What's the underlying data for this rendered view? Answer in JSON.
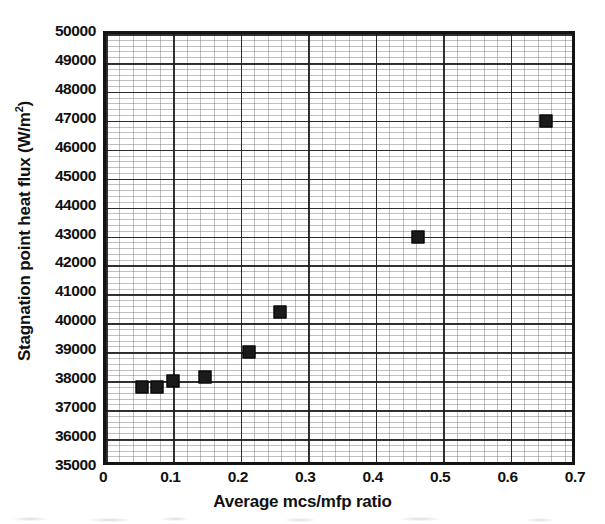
{
  "chart_data": {
    "type": "scatter",
    "title": "",
    "xlabel": "Average mcs/mfp ratio",
    "ylabel": "Stagnation point heat flux (W/m2)",
    "ylabel_base": "Stagnation point heat flux (W/m",
    "ylabel_sup": "2",
    "ylabel_tail": ")",
    "xlim": [
      0,
      0.7
    ],
    "ylim": [
      35000,
      50000
    ],
    "xticks": [
      "0",
      "0.1",
      "0.2",
      "0.3",
      "0.4",
      "0.5",
      "0.6",
      "0.7"
    ],
    "xtick_values": [
      0,
      0.1,
      0.2,
      0.3,
      0.4,
      0.5,
      0.6,
      0.7
    ],
    "yticks": [
      "35000",
      "36000",
      "37000",
      "38000",
      "39000",
      "40000",
      "41000",
      "42000",
      "43000",
      "44000",
      "45000",
      "46000",
      "47000",
      "48000",
      "49000",
      "50000"
    ],
    "ytick_values": [
      35000,
      36000,
      37000,
      38000,
      39000,
      40000,
      41000,
      42000,
      43000,
      44000,
      45000,
      46000,
      47000,
      48000,
      49000,
      50000
    ],
    "grid": true,
    "minor_grid": true,
    "minor_divisions_x": 5,
    "minor_divisions_y": 5,
    "legend": null,
    "marker": "filled-square",
    "marker_color": "#1a1a1a",
    "x": [
      0.053,
      0.075,
      0.1,
      0.147,
      0.212,
      0.258,
      0.462,
      0.652
    ],
    "y": [
      37800,
      37800,
      38000,
      38150,
      39000,
      40400,
      43000,
      47000
    ],
    "points": [
      {
        "x": 0.053,
        "y": 37800
      },
      {
        "x": 0.075,
        "y": 37800
      },
      {
        "x": 0.1,
        "y": 38000
      },
      {
        "x": 0.147,
        "y": 38150
      },
      {
        "x": 0.212,
        "y": 39000
      },
      {
        "x": 0.258,
        "y": 40400
      },
      {
        "x": 0.462,
        "y": 43000
      },
      {
        "x": 0.652,
        "y": 47000
      }
    ]
  },
  "colors": {
    "frame": "#141414",
    "major_grid": "#191919",
    "minor_grid": "#696969",
    "marker": "#1a1a1a",
    "text": "#111111",
    "background": "#ffffff"
  }
}
